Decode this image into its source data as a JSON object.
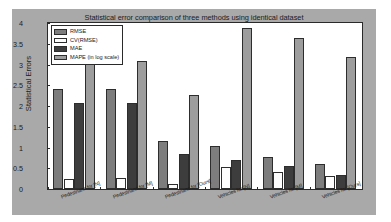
{
  "chart_data": {
    "type": "bar",
    "title": "Statistical error comparison of three methods using identical dataset",
    "xlabel": "",
    "ylabel": "Statistical Errors",
    "ylim": [
      0,
      4
    ],
    "yticks": [
      "0",
      "0.5",
      "1",
      "1.5",
      "2",
      "2.5",
      "3",
      "3.5",
      "4"
    ],
    "ytick_values": [
      0,
      0.5,
      1,
      1.5,
      2,
      2.5,
      3,
      3.5,
      4
    ],
    "grid": false,
    "legend_position": "upper-left",
    "categories": [
      "Pedestrians for [N]",
      "Pedestrians for [M]",
      "Pedestrians for [Ours]",
      "Vehicles for [N]",
      "Vehicles for [M]",
      "Vehicles for [Ours]"
    ],
    "series": [
      {
        "name": "RMSE",
        "color": "#7d7d7d",
        "values": [
          2.4,
          2.41,
          1.16,
          1.03,
          0.78,
          0.6
        ]
      },
      {
        "name": "CV(RMSE)",
        "color": "#fdfdfd",
        "values": [
          0.25,
          0.26,
          0.13,
          0.53,
          0.4,
          0.32
        ]
      },
      {
        "name": "MAE",
        "color": "#3d3d3d",
        "values": [
          2.07,
          2.07,
          0.84,
          0.71,
          0.56,
          0.33
        ]
      },
      {
        "name": "MAPE (in log scale)",
        "color": "#9d9d9d",
        "values": [
          3.09,
          3.09,
          2.27,
          3.87,
          3.63,
          3.19
        ]
      }
    ]
  },
  "legend": {
    "items": [
      {
        "label": "RMSE"
      },
      {
        "label": "CV(RMSE)"
      },
      {
        "label": "MAE"
      },
      {
        "label": "MAPE (in log scale)"
      }
    ]
  },
  "colors": {
    "figure_background": "#a9a9a9",
    "axes_background": "#ffffff",
    "axis_line": "#2a2a2a",
    "text": "#1b1b1b"
  }
}
